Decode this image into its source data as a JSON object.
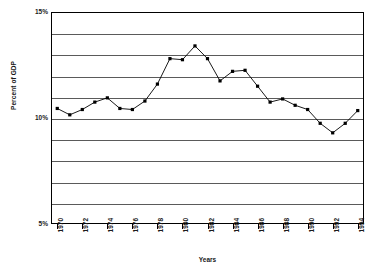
{
  "chart_data": {
    "type": "line",
    "title": "",
    "xlabel": "Years",
    "ylabel": "Percent of GDP",
    "ylim": [
      5,
      15
    ],
    "xlim": [
      1969.5,
      1994.5
    ],
    "ytick_labels": [
      "15%",
      "10%",
      "5%"
    ],
    "ytick_values": [
      15,
      10,
      5
    ],
    "gridlines_y": [
      14,
      13,
      12,
      11,
      10,
      9,
      8,
      7,
      6
    ],
    "grid": true,
    "legend": "none",
    "marker": "square",
    "marker_color": "#000000",
    "line_color": "#000000",
    "x": [
      1970,
      1971,
      1972,
      1973,
      1974,
      1975,
      1976,
      1977,
      1978,
      1979,
      1980,
      1981,
      1982,
      1983,
      1984,
      1985,
      1986,
      1987,
      1988,
      1989,
      1990,
      1991,
      1992,
      1993,
      1994
    ],
    "xtick_labels": [
      "1970",
      "1972",
      "1974",
      "1976",
      "1978",
      "1980",
      "1982",
      "1984",
      "1986",
      "1988",
      "1990",
      "1992",
      "1994"
    ],
    "xtick_values": [
      1970,
      1972,
      1974,
      1976,
      1978,
      1980,
      1982,
      1984,
      1986,
      1988,
      1990,
      1992,
      1994
    ],
    "values": [
      10.45,
      10.15,
      10.4,
      10.75,
      10.95,
      10.45,
      10.4,
      10.8,
      11.6,
      12.8,
      12.75,
      13.4,
      12.8,
      11.75,
      12.2,
      12.25,
      11.5,
      10.75,
      10.9,
      10.6,
      10.4,
      9.75,
      9.3,
      9.75,
      10.35
    ]
  }
}
